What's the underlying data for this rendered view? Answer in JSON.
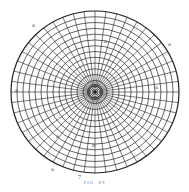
{
  "figure": {
    "caption": "FIG. 85",
    "center": {
      "x": 95,
      "y": 92
    },
    "radius_x": 84,
    "radius_y": 81,
    "ring_count": 14,
    "spoke_count": 48,
    "line_color": "#222222",
    "reference_labels": [
      {
        "text": "a",
        "x": 32,
        "y": 25
      },
      {
        "text": "a",
        "x": 168,
        "y": 44
      },
      {
        "text": "a",
        "x": 15,
        "y": 90
      },
      {
        "text": "a",
        "x": 155,
        "y": 87
      },
      {
        "text": "a",
        "x": 104,
        "y": 41
      },
      {
        "text": "a",
        "x": 56,
        "y": 136
      },
      {
        "text": "a",
        "x": 92,
        "y": 145
      },
      {
        "text": "a",
        "x": 51,
        "y": 169
      },
      {
        "text": "7",
        "x": 78,
        "y": 177
      }
    ]
  }
}
